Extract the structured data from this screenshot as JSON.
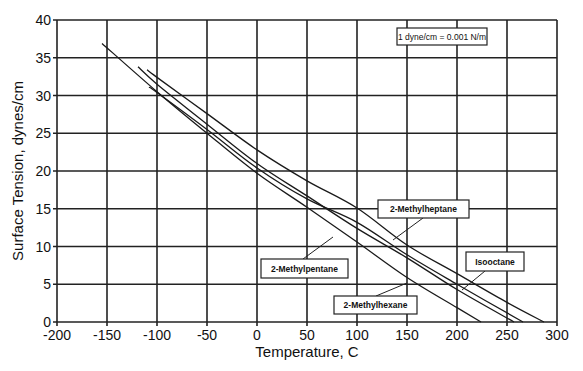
{
  "chart_data": {
    "type": "line",
    "title": "",
    "xlabel": "Temperature, C",
    "ylabel": "Surface Tension,  dynes/cm",
    "xlim": [
      -200,
      300
    ],
    "ylim": [
      0,
      40
    ],
    "xticks": [
      -200,
      -150,
      -100,
      -50,
      0,
      50,
      100,
      150,
      200,
      250,
      300
    ],
    "yticks": [
      0,
      5,
      10,
      15,
      20,
      25,
      30,
      35,
      40
    ],
    "grid": true,
    "annotation": "1 dyne/cm = 0.001 N/m",
    "series": [
      {
        "name": "2-Methylpentane",
        "x": [
          -155,
          -100,
          -50,
          0,
          50,
          100,
          150,
          200,
          224
        ],
        "y": [
          36.9,
          30.5,
          25.0,
          19.7,
          15.2,
          10.6,
          5.9,
          1.9,
          0
        ]
      },
      {
        "name": "2-Methylhexane",
        "x": [
          -119,
          -100,
          -50,
          0,
          50,
          100,
          150,
          200,
          257
        ],
        "y": [
          33.8,
          31.5,
          26.2,
          21.0,
          16.7,
          12.4,
          8.5,
          4.3,
          0
        ]
      },
      {
        "name": "Isooctane",
        "x": [
          -108,
          -100,
          -50,
          0,
          50,
          100,
          150,
          200,
          266
        ],
        "y": [
          31.1,
          30.4,
          25.5,
          20.4,
          16.3,
          13.2,
          8.9,
          5.0,
          0
        ]
      },
      {
        "name": "2-Methylheptane",
        "x": [
          -110,
          -100,
          -50,
          0,
          50,
          100,
          150,
          200,
          250,
          287
        ],
        "y": [
          33.4,
          32.4,
          27.6,
          22.8,
          18.7,
          15.1,
          10.2,
          6.4,
          2.6,
          0
        ]
      }
    ],
    "labels": [
      {
        "text": "2-Methylpentane",
        "box": [
          261,
          259,
          87,
          19
        ],
        "leader": [
          [
            303,
            259
          ],
          [
            333,
            237
          ]
        ]
      },
      {
        "text": "2-Methylhexane",
        "box": [
          334,
          296,
          83,
          18
        ],
        "leader": [
          [
            376,
            296
          ],
          [
            407,
            283
          ]
        ]
      },
      {
        "text": "Isooctane",
        "box": [
          466,
          252,
          58,
          19
        ],
        "leader": [
          [
            485,
            271
          ],
          [
            462,
            290
          ]
        ]
      },
      {
        "text": "2-Methylheptane",
        "box": [
          378,
          200,
          91,
          18
        ],
        "leader": [
          [
            423,
            218
          ],
          [
            393,
            240
          ]
        ]
      }
    ],
    "note_box": [
      397,
      28,
      90,
      17
    ]
  }
}
